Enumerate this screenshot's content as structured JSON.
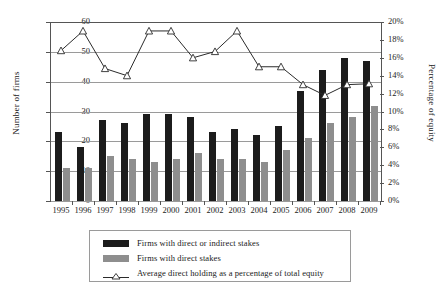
{
  "chart_data": {
    "type": "bar",
    "title": "",
    "xlabel": "",
    "ylabel": "Number of firms",
    "y2label": "Percentage of equity",
    "categories": [
      "1995",
      "1996",
      "1997",
      "1998",
      "1999",
      "2000",
      "2001",
      "2002",
      "2003",
      "2004",
      "2005",
      "2006",
      "2007",
      "2008",
      "2009"
    ],
    "ylim": [
      0,
      60
    ],
    "yticks": [
      "0",
      "10",
      "20",
      "30",
      "40",
      "50",
      "60"
    ],
    "y2lim": [
      0,
      20
    ],
    "y2ticks": [
      "0%",
      "2%",
      "4%",
      "6%",
      "8%",
      "10%",
      "12%",
      "14%",
      "16%",
      "18%",
      "20%"
    ],
    "grid": true,
    "legend_position": "bottom",
    "series": [
      {
        "name": "Firms with direct or indirect stakes",
        "type": "bar",
        "axis": "left",
        "color": "#1c1c1c",
        "values": [
          23,
          18,
          27,
          26,
          29,
          29,
          28,
          23,
          24,
          22,
          25,
          37,
          44,
          48,
          47
        ]
      },
      {
        "name": "Firms with direct stakes",
        "type": "bar",
        "axis": "left",
        "color": "#8e8e8e",
        "values": [
          11,
          11,
          15,
          14,
          13,
          14,
          16,
          14,
          14,
          13,
          17,
          21,
          26,
          28,
          32
        ]
      },
      {
        "name": "Average direct holding as a percentage of total equity",
        "type": "line",
        "axis": "right",
        "color": "#2b2b2b",
        "marker": "triangle-up-open",
        "values": [
          16.8,
          19.0,
          14.8,
          14.0,
          19.0,
          19.0,
          16.0,
          16.7,
          19.0,
          15.0,
          15.0,
          13.0,
          11.8,
          13.0,
          13.1
        ]
      }
    ]
  },
  "legend": {
    "items": [
      {
        "label": "Firms with direct or indirect stakes",
        "swatch": "dark-square",
        "color": "#1c1c1c"
      },
      {
        "label": "Firms with direct stakes",
        "swatch": "grey-square",
        "color": "#8e8e8e"
      },
      {
        "label": "Average direct holding as a percentage of total equity",
        "swatch": "line-triangle-marker",
        "color": "#2b2b2b"
      }
    ]
  }
}
